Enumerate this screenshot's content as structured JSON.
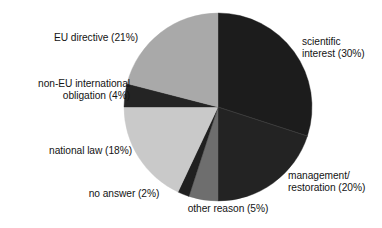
{
  "chart_data": {
    "type": "pie",
    "title": "",
    "subtitle": "",
    "xlabel": "",
    "ylabel": "",
    "legend_position": "none",
    "grid": false,
    "start_angle_deg": 0,
    "direction": "clockwise",
    "categories": [
      "scientific interest",
      "management/restoration",
      "other reason",
      "no answer",
      "national law",
      "non-EU international obligation",
      "EU directive"
    ],
    "values": [
      30,
      20,
      5,
      2,
      18,
      4,
      21
    ],
    "unit": "%",
    "slices": [
      {
        "id": "scientific-interest",
        "label": "scientific\ninterest (30%)",
        "name": "scientific interest",
        "value": 30,
        "color": "#1c1c1c",
        "start_deg": 0,
        "end_deg": 108
      },
      {
        "id": "management-restoration",
        "label": "management/\nrestoration (20%)",
        "name": "management/restoration",
        "value": 20,
        "color": "#232323",
        "start_deg": 108,
        "end_deg": 180
      },
      {
        "id": "other-reason",
        "label": "other reason (5%)",
        "name": "other reason",
        "value": 5,
        "color": "#6e6e6e",
        "start_deg": 180,
        "end_deg": 198
      },
      {
        "id": "no-answer",
        "label": "no answer (2%)",
        "name": "no answer",
        "value": 2,
        "color": "#202020",
        "start_deg": 198,
        "end_deg": 205.2
      },
      {
        "id": "national-law",
        "label": "national law (18%)",
        "name": "national law",
        "value": 18,
        "color": "#c9c9c9",
        "start_deg": 205.2,
        "end_deg": 270
      },
      {
        "id": "non-eu-obligation",
        "label": "non-EU international\nobligation (4%)",
        "name": "non-EU international obligation",
        "value": 4,
        "color": "#242424",
        "start_deg": 270,
        "end_deg": 284.4
      },
      {
        "id": "eu-directive",
        "label": "EU directive (21%)",
        "name": "EU directive",
        "value": 21,
        "color": "#a9a9a9",
        "start_deg": 284.4,
        "end_deg": 360
      }
    ],
    "geometry": {
      "center_x": 218,
      "center_y": 107,
      "radius": 94
    },
    "background_color": "#ffffff",
    "text_color": "#141414"
  }
}
